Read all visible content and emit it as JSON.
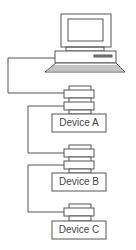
{
  "diagram": {
    "type": "daisy-chain",
    "host": {
      "name": "computer",
      "icon": "computer-icon"
    },
    "devices": [
      {
        "label": "Device A"
      },
      {
        "label": "Device B"
      },
      {
        "label": "Device C"
      }
    ],
    "colors": {
      "stroke": "#555555",
      "background": "#ffffff"
    }
  }
}
